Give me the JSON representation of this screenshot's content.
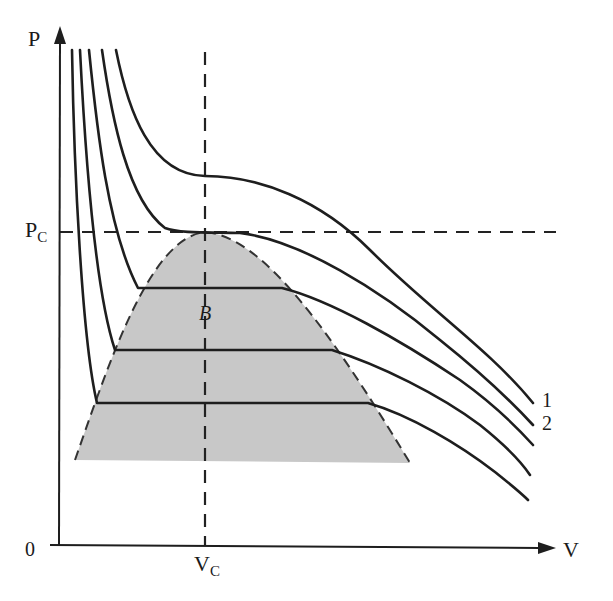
{
  "colors": {
    "line": "#1e1e1e",
    "dome_fill": "#c8c8c8",
    "background": "#ffffff"
  },
  "axes": {
    "y_label": "P",
    "x_label": "V",
    "origin_label": "0",
    "critical_pressure_label": "P",
    "critical_pressure_sub": "C",
    "critical_volume_label": "V",
    "critical_volume_sub": "C"
  },
  "annotations": {
    "point_label": "B",
    "curve_1_label": "1",
    "curve_2_label": "2"
  },
  "isotherms": [
    {
      "id": "1",
      "note": "highest temperature, above critical"
    },
    {
      "id": "2",
      "note": "critical isotherm, tangent at critical point"
    },
    {
      "id": "3",
      "note": "below critical, tie line at upper level"
    },
    {
      "id": "4",
      "note": "below critical, tie line at middle level"
    },
    {
      "id": "5",
      "note": "below critical, tie line at lower level"
    }
  ],
  "regions": {
    "two_phase_dome": "shaded coexistence region bounded by dashed curve"
  }
}
